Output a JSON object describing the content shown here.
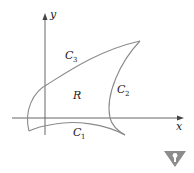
{
  "diagram": {
    "axes": {
      "x_label": "x",
      "y_label": "y"
    },
    "region_label": "R",
    "curves": [
      {
        "name": "C",
        "sub": "1"
      },
      {
        "name": "C",
        "sub": "2"
      },
      {
        "name": "C",
        "sub": "3"
      }
    ],
    "colors": {
      "stroke": "#8a8a8a",
      "axis": "#555555",
      "badge": "#8c8c8c"
    }
  },
  "badge": {
    "icon": "warning-triangle-icon"
  }
}
